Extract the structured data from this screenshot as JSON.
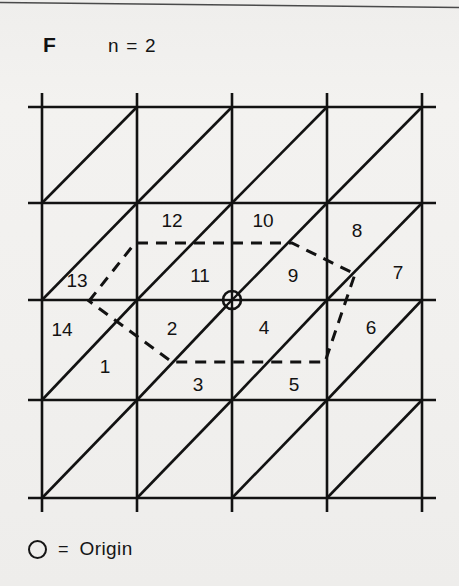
{
  "figure": {
    "panel_label": "F",
    "parameter_text": "n = 2",
    "background_color": "#f2f1ef",
    "ink_color": "#121212"
  },
  "legend": {
    "symbol_name": "origin-circle",
    "equals": "=",
    "text": "Origin"
  },
  "lattice": {
    "description": "Square lattice with diagonal lines forming triangular cells; dashed polygon outlines the second-neighbour region around the origin.",
    "grid_x_positions": [
      42,
      137,
      232,
      327,
      422
    ],
    "grid_y_positions": [
      107,
      203,
      300,
      400,
      498
    ],
    "overhang": 14,
    "line_width": 2.6,
    "diagonal_direction": "lower-left to upper-right",
    "origin": {
      "x": 232,
      "y": 300,
      "radius": 9
    }
  },
  "dashed_region": {
    "name": "second-neighbour-cell-boundary",
    "dash_pattern": "11 8",
    "line_width": 3.0,
    "vertices": [
      {
        "x": 89,
        "y": 301
      },
      {
        "x": 135,
        "y": 243
      },
      {
        "x": 292,
        "y": 243
      },
      {
        "x": 355,
        "y": 274
      },
      {
        "x": 325,
        "y": 362
      },
      {
        "x": 172,
        "y": 362
      }
    ]
  },
  "cell_labels": [
    {
      "id": "1",
      "text": "1",
      "x": 105,
      "y": 368
    },
    {
      "id": "2",
      "text": "2",
      "x": 172,
      "y": 330
    },
    {
      "id": "3",
      "text": "3",
      "x": 198,
      "y": 386
    },
    {
      "id": "4",
      "text": "4",
      "x": 264,
      "y": 329
    },
    {
      "id": "5",
      "text": "5",
      "x": 294,
      "y": 386
    },
    {
      "id": "6",
      "text": "6",
      "x": 371,
      "y": 329
    },
    {
      "id": "7",
      "text": "7",
      "x": 398,
      "y": 274
    },
    {
      "id": "8",
      "text": "8",
      "x": 357,
      "y": 232
    },
    {
      "id": "9",
      "text": "9",
      "x": 293,
      "y": 277
    },
    {
      "id": "10",
      "text": "10",
      "x": 263,
      "y": 222
    },
    {
      "id": "11",
      "text": "11",
      "x": 200,
      "y": 277
    },
    {
      "id": "12",
      "text": "12",
      "x": 172,
      "y": 222
    },
    {
      "id": "13",
      "text": "13",
      "x": 77,
      "y": 282
    },
    {
      "id": "14",
      "text": "14",
      "x": 62,
      "y": 331
    }
  ]
}
